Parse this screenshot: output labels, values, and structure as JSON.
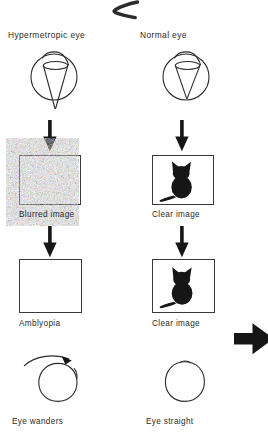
{
  "figure": {
    "title_visible": false,
    "background_color": "#ffffff",
    "ink_color": "#1a1a1a",
    "columns": [
      {
        "id": "left",
        "heading": "Hypermetropic eye",
        "eye_diagram": {
          "name": "hypermetropic-eye",
          "focus": "behind-retina",
          "cone_apex_outside_globe": true
        },
        "steps": [
          {
            "label": "Blurred image",
            "content": "blurred-cat"
          },
          {
            "label": "Amblyopia",
            "content": "empty"
          }
        ],
        "outcome": {
          "label": "Eye wanders",
          "has_deviation_arrow": true
        }
      },
      {
        "id": "right",
        "heading": "Normal eye",
        "eye_diagram": {
          "name": "normal-eye",
          "focus": "on-retina",
          "cone_apex_outside_globe": false
        },
        "steps": [
          {
            "label": "Clear image",
            "content": "clear-cat"
          },
          {
            "label": "Clear image",
            "content": "clear-cat"
          }
        ],
        "outcome": {
          "label": "Eye straight",
          "has_deviation_arrow": false
        }
      }
    ],
    "flow_arrows": {
      "direction": "down",
      "count": 4,
      "color": "#161616"
    },
    "continuation_arrow": {
      "name": "continue-right-arrow",
      "direction": "right",
      "color": "#161616"
    },
    "top_mark": {
      "name": "ink-stroke-mark",
      "color": "#2b2b2b"
    }
  }
}
